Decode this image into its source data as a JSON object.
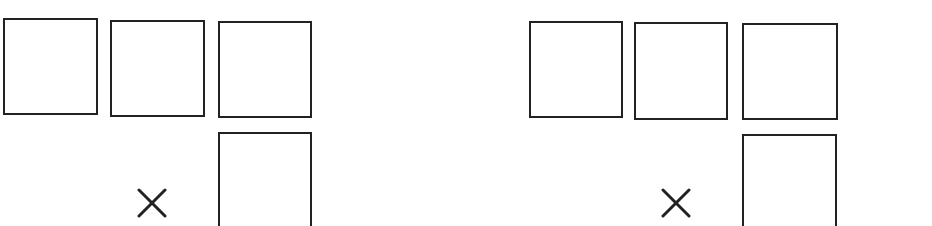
{
  "diagram": {
    "stroke_color": "#222222",
    "background": "#ffffff",
    "groups": [
      {
        "name": "left-group",
        "operator": "×",
        "operator_icon": "multiply-icon",
        "boxes": [
          {
            "role": "top-digit-1",
            "value": ""
          },
          {
            "role": "top-digit-2",
            "value": ""
          },
          {
            "role": "top-digit-3",
            "value": ""
          },
          {
            "role": "multiplier-digit",
            "value": ""
          }
        ]
      },
      {
        "name": "right-group",
        "operator": "×",
        "operator_icon": "multiply-icon",
        "boxes": [
          {
            "role": "top-digit-1",
            "value": ""
          },
          {
            "role": "top-digit-2",
            "value": ""
          },
          {
            "role": "top-digit-3",
            "value": ""
          },
          {
            "role": "multiplier-digit",
            "value": ""
          }
        ]
      }
    ]
  }
}
